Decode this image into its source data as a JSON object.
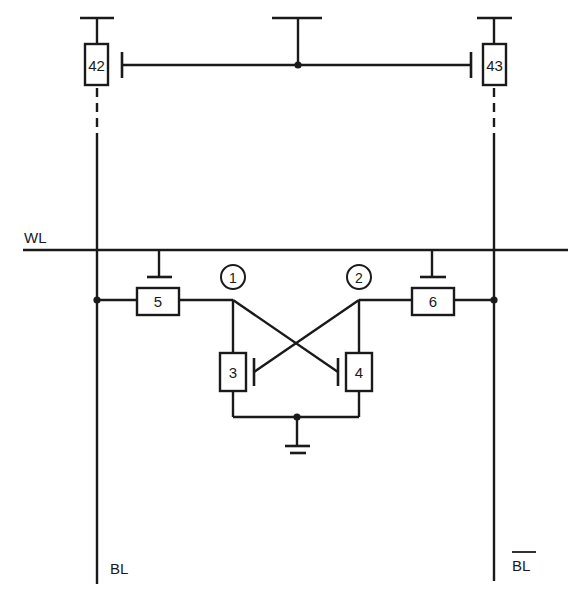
{
  "diagram": {
    "type": "circuit-schematic",
    "colors": {
      "stroke": "#1a1a1a",
      "background": "#ffffff"
    },
    "labels": {
      "word_line": "WL",
      "bit_line": "BL",
      "bit_line_bar": "BL"
    },
    "transistors": [
      {
        "id": "42",
        "label": "42",
        "role": "bit-line load (left)"
      },
      {
        "id": "43",
        "label": "43",
        "role": "bit-line load (right)"
      },
      {
        "id": "5",
        "label": "5",
        "role": "access transistor (left)"
      },
      {
        "id": "6",
        "label": "6",
        "role": "access transistor (right)"
      },
      {
        "id": "3",
        "label": "3",
        "role": "pull-down (left)"
      },
      {
        "id": "4",
        "label": "4",
        "role": "pull-down (right)"
      }
    ],
    "nodes": [
      {
        "id": "1",
        "label": "1"
      },
      {
        "id": "2",
        "label": "2"
      }
    ],
    "symbols": [
      "power-supply-bar",
      "ground-symbol",
      "junction-dot"
    ]
  }
}
